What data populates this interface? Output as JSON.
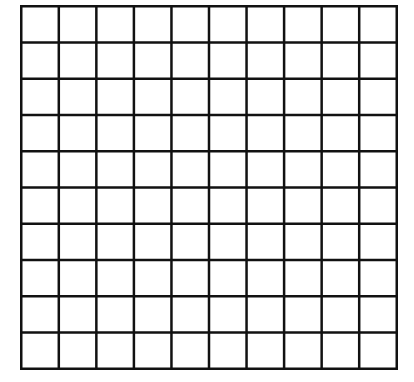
{
  "diagram": {
    "type": "grid",
    "rows": 10,
    "columns": 10,
    "line_color": "#111111",
    "background": "#ffffff",
    "line_width": 2.5
  }
}
